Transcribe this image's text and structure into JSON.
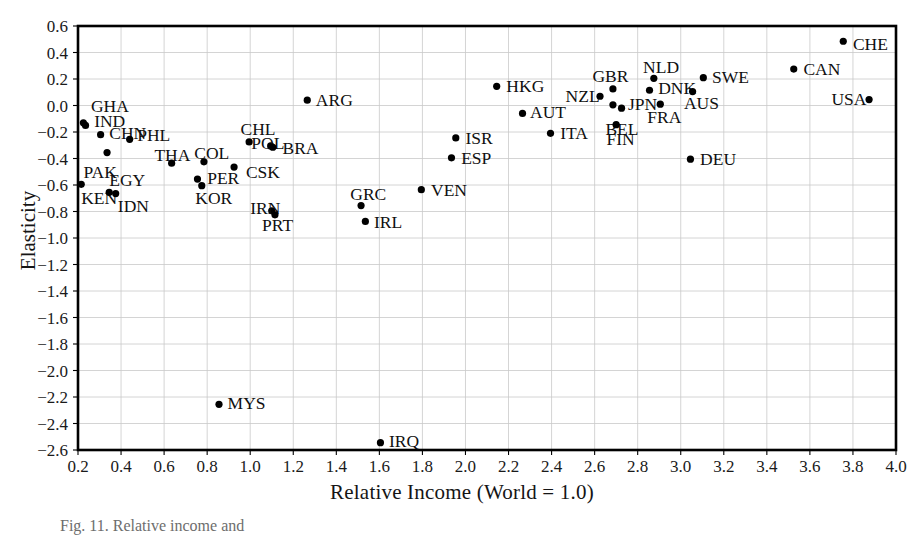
{
  "figure": {
    "caption": "Fig. 11. Relative income and",
    "background_color": "#ffffff",
    "frame_color": "#000000",
    "grid_color": "#c9c9c9",
    "point_color": "#000000"
  },
  "chart_data": {
    "type": "scatter",
    "title": "",
    "xlabel": "Relative Income (World = 1.0)",
    "ylabel": "Elasticity",
    "xlim": [
      0.2,
      4.0
    ],
    "ylim": [
      -2.6,
      0.6
    ],
    "grid": true,
    "legend_position": "none",
    "xticks": [
      "0.2",
      "0.4",
      "0.6",
      "0.8",
      "1.0",
      "1.2",
      "1.4",
      "1.6",
      "1.8",
      "2.0",
      "2.2",
      "2.4",
      "2.6",
      "2.8",
      "3.0",
      "3.2",
      "3.4",
      "3.6",
      "3.8",
      "4.0"
    ],
    "yticks": [
      "0.6",
      "0.4",
      "0.2",
      "0.0",
      "-0.2",
      "-0.4",
      "-0.6",
      "-0.8",
      "-1.0",
      "-1.2",
      "-1.4",
      "-1.6",
      "-1.8",
      "-2.0",
      "-2.2",
      "-2.4",
      "-2.6"
    ],
    "points": [
      {
        "label": "GHA",
        "x": 0.225,
        "y": -0.13,
        "lx": 0.26,
        "ly": 0.0,
        "anchor": "start"
      },
      {
        "label": "IND",
        "x": 0.235,
        "y": -0.15,
        "lx": 0.275,
        "ly": -0.115,
        "anchor": "start"
      },
      {
        "label": "CHN",
        "x": 0.305,
        "y": -0.22,
        "lx": 0.345,
        "ly": -0.21,
        "anchor": "start"
      },
      {
        "label": "PAK",
        "x": 0.335,
        "y": -0.355,
        "lx": 0.225,
        "ly": -0.5,
        "anchor": "start"
      },
      {
        "label": "KEN",
        "x": 0.215,
        "y": -0.595,
        "lx": 0.215,
        "ly": -0.695,
        "anchor": "start"
      },
      {
        "label": "EGY",
        "x": 0.345,
        "y": -0.655,
        "lx": 0.345,
        "ly": -0.565,
        "anchor": "start"
      },
      {
        "label": "IDN",
        "x": 0.375,
        "y": -0.665,
        "lx": 0.385,
        "ly": -0.755,
        "anchor": "start"
      },
      {
        "label": "PHL",
        "x": 0.44,
        "y": -0.255,
        "lx": 0.475,
        "ly": -0.225,
        "anchor": "start"
      },
      {
        "label": "THA",
        "x": 0.635,
        "y": -0.435,
        "lx": 0.555,
        "ly": -0.375,
        "anchor": "start"
      },
      {
        "label": "COL",
        "x": 0.785,
        "y": -0.425,
        "lx": 0.74,
        "ly": -0.36,
        "anchor": "start"
      },
      {
        "label": "CHL",
        "x": 0.995,
        "y": -0.275,
        "lx": 0.955,
        "ly": -0.18,
        "anchor": "start"
      },
      {
        "label": "CSK",
        "x": 0.925,
        "y": -0.465,
        "lx": 0.98,
        "ly": -0.5,
        "anchor": "start"
      },
      {
        "label": "PER",
        "x": 0.755,
        "y": -0.555,
        "lx": 0.8,
        "ly": -0.545,
        "anchor": "start"
      },
      {
        "label": "KOR",
        "x": 0.775,
        "y": -0.605,
        "lx": 0.745,
        "ly": -0.695,
        "anchor": "start"
      },
      {
        "label": "POL",
        "x": 1.095,
        "y": -0.305,
        "lx": 1.005,
        "ly": -0.285,
        "anchor": "start"
      },
      {
        "label": "BRA",
        "x": 1.105,
        "y": -0.315,
        "lx": 1.15,
        "ly": -0.32,
        "anchor": "start"
      },
      {
        "label": "IRN",
        "x": 1.1,
        "y": -0.795,
        "lx": 1.0,
        "ly": -0.775,
        "anchor": "start"
      },
      {
        "label": "PRT",
        "x": 1.115,
        "y": -0.825,
        "lx": 1.055,
        "ly": -0.9,
        "anchor": "start"
      },
      {
        "label": "ARG",
        "x": 1.265,
        "y": 0.04,
        "lx": 1.305,
        "ly": 0.045,
        "anchor": "start"
      },
      {
        "label": "GRC",
        "x": 1.515,
        "y": -0.755,
        "lx": 1.465,
        "ly": -0.665,
        "anchor": "start"
      },
      {
        "label": "IRL",
        "x": 1.535,
        "y": -0.875,
        "lx": 1.575,
        "ly": -0.88,
        "anchor": "start"
      },
      {
        "label": "MYS",
        "x": 0.855,
        "y": -2.255,
        "lx": 0.895,
        "ly": -2.245,
        "anchor": "start"
      },
      {
        "label": "IRQ",
        "x": 1.605,
        "y": -2.545,
        "lx": 1.645,
        "ly": -2.535,
        "anchor": "start"
      },
      {
        "label": "VEN",
        "x": 1.795,
        "y": -0.635,
        "lx": 1.84,
        "ly": -0.635,
        "anchor": "start"
      },
      {
        "label": "ISR",
        "x": 1.955,
        "y": -0.245,
        "lx": 2.0,
        "ly": -0.245,
        "anchor": "start"
      },
      {
        "label": "ESP",
        "x": 1.935,
        "y": -0.395,
        "lx": 1.98,
        "ly": -0.395,
        "anchor": "start"
      },
      {
        "label": "HKG",
        "x": 2.145,
        "y": 0.145,
        "lx": 2.19,
        "ly": 0.15,
        "anchor": "start"
      },
      {
        "label": "AUT",
        "x": 2.265,
        "y": -0.06,
        "lx": 2.3,
        "ly": -0.05,
        "anchor": "start"
      },
      {
        "label": "ITA",
        "x": 2.395,
        "y": -0.21,
        "lx": 2.44,
        "ly": -0.21,
        "anchor": "start"
      },
      {
        "label": "NZL",
        "x": 2.625,
        "y": 0.07,
        "lx": 2.465,
        "ly": 0.075,
        "anchor": "start"
      },
      {
        "label": "GBR",
        "x": 2.685,
        "y": 0.125,
        "lx": 2.59,
        "ly": 0.22,
        "anchor": "start"
      },
      {
        "label": "BEL",
        "x": 2.685,
        "y": 0.005,
        "lx": 2.65,
        "ly": -0.175,
        "anchor": "start"
      },
      {
        "label": "JPN",
        "x": 2.725,
        "y": -0.02,
        "lx": 2.755,
        "ly": 0.015,
        "anchor": "start"
      },
      {
        "label": "FIN",
        "x": 2.7,
        "y": -0.145,
        "lx": 2.655,
        "ly": -0.255,
        "anchor": "start"
      },
      {
        "label": "NLD",
        "x": 2.875,
        "y": 0.205,
        "lx": 2.825,
        "ly": 0.29,
        "anchor": "start"
      },
      {
        "label": "DNK",
        "x": 2.855,
        "y": 0.115,
        "lx": 2.895,
        "ly": 0.135,
        "anchor": "start"
      },
      {
        "label": "FRA",
        "x": 2.905,
        "y": 0.01,
        "lx": 2.845,
        "ly": -0.09,
        "anchor": "start"
      },
      {
        "label": "AUS",
        "x": 3.055,
        "y": 0.105,
        "lx": 3.015,
        "ly": 0.02,
        "anchor": "start"
      },
      {
        "label": "SWE",
        "x": 3.105,
        "y": 0.21,
        "lx": 3.145,
        "ly": 0.215,
        "anchor": "start"
      },
      {
        "label": "DEU",
        "x": 3.045,
        "y": -0.405,
        "lx": 3.09,
        "ly": -0.405,
        "anchor": "start"
      },
      {
        "label": "CAN",
        "x": 3.525,
        "y": 0.275,
        "lx": 3.57,
        "ly": 0.275,
        "anchor": "start"
      },
      {
        "label": "CHE",
        "x": 3.755,
        "y": 0.485,
        "lx": 3.8,
        "ly": 0.465,
        "anchor": "start"
      },
      {
        "label": "USA",
        "x": 3.875,
        "y": 0.045,
        "lx": 3.7,
        "ly": 0.05,
        "anchor": "start"
      }
    ]
  }
}
